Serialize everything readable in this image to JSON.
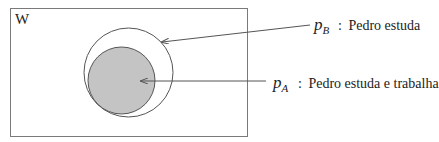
{
  "diagram": {
    "type": "venn",
    "universe": {
      "label": "W",
      "rect": {
        "x": 10.5,
        "y": 8.5,
        "width": 237,
        "height": 128
      },
      "stroke": "#7a7a7a"
    },
    "sets": [
      {
        "id": "pB",
        "symbol_base": "p",
        "symbol_sub": "B",
        "separator": ":",
        "description": "Pedro estuda",
        "circle": {
          "cx": 128.5,
          "cy": 72.5,
          "r": 44.5
        },
        "fill": "none",
        "stroke": "#555555"
      },
      {
        "id": "pA",
        "symbol_base": "p",
        "symbol_sub": "A",
        "separator": ":",
        "description": "Pedro estuda e trabalha",
        "circle": {
          "cx": 121.5,
          "cy": 80.5,
          "r": 33.5
        },
        "fill": "#c4c4c4",
        "stroke": "#555555"
      }
    ],
    "pointers": [
      {
        "target": "pB",
        "from": {
          "x": 310,
          "y": 25
        },
        "to": {
          "x": 162,
          "y": 42
        }
      },
      {
        "target": "pA",
        "from": {
          "x": 266,
          "y": 81
        },
        "to": {
          "x": 141,
          "y": 81
        }
      }
    ],
    "colors": {
      "line": "#555555",
      "text": "#222222",
      "inner_fill": "#c4c4c4"
    }
  }
}
